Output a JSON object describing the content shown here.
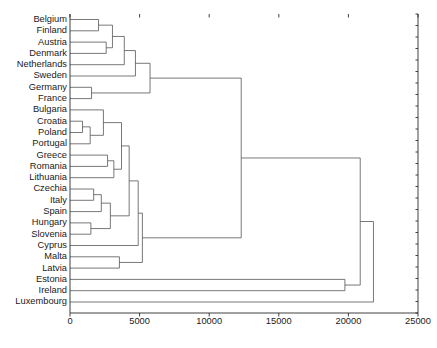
{
  "chart_data": {
    "type": "dendrogram",
    "title": "",
    "xlabel": "",
    "ylabel": "",
    "xlim": [
      0,
      25000
    ],
    "xticks": [
      0,
      5000,
      10000,
      15000,
      20000,
      25000
    ],
    "xtick_labels": [
      "0",
      "5000",
      "10000",
      "15000",
      "20000",
      "25000"
    ],
    "grid": false,
    "orientation": "left",
    "leaf_order": [
      "Belgium",
      "Finland",
      "Austria",
      "Denmark",
      "Netherlands",
      "Sweden",
      "Germany",
      "France",
      "Bulgaria",
      "Croatia",
      "Poland",
      "Portugal",
      "Greece",
      "Romania",
      "Lithuania",
      "Czechia",
      "Italy",
      "Spain",
      "Hungary",
      "Slovenia",
      "Cyprus",
      "Malta",
      "Latvia",
      "Estonia",
      "Ireland",
      "Luxembourg"
    ],
    "leaf_labels": [
      "Belgium",
      "Finland",
      "Austria",
      "Denmark",
      "Netherlands",
      "Sweden",
      "Germany",
      "France",
      "Bulgaria",
      "Croatia",
      "Poland",
      "Portugal",
      "Greece",
      "Romania",
      "Lithuania",
      "Czechia",
      "Italy",
      "Spain",
      "Hungary",
      "Slovenia",
      "Cyprus",
      "Malta",
      "Latvia",
      "Estonia",
      "Ireland",
      "Luxembourg"
    ],
    "merges": [
      {
        "id": "m1",
        "left": "Belgium",
        "right": "Finland",
        "distance": 2050
      },
      {
        "id": "m2",
        "left": "Austria",
        "right": "Denmark",
        "distance": 2600
      },
      {
        "id": "m3",
        "left": "m1",
        "right": "m2",
        "distance": 3050
      },
      {
        "id": "m4",
        "left": "m3",
        "right": "Netherlands",
        "distance": 3900
      },
      {
        "id": "m5",
        "left": "m4",
        "right": "Sweden",
        "distance": 4700
      },
      {
        "id": "m6",
        "left": "Germany",
        "right": "France",
        "distance": 1550
      },
      {
        "id": "m7",
        "left": "m5",
        "right": "m6",
        "distance": 5750
      },
      {
        "id": "m8",
        "left": "Croatia",
        "right": "Poland",
        "distance": 900
      },
      {
        "id": "m9",
        "left": "m8",
        "right": "Portugal",
        "distance": 1450
      },
      {
        "id": "m10",
        "left": "Bulgaria",
        "right": "m9",
        "distance": 2400
      },
      {
        "id": "m11",
        "left": "Greece",
        "right": "Romania",
        "distance": 2700
      },
      {
        "id": "m12",
        "left": "m11",
        "right": "Lithuania",
        "distance": 3150
      },
      {
        "id": "m13",
        "left": "m10",
        "right": "m12",
        "distance": 3700
      },
      {
        "id": "m14",
        "left": "Czechia",
        "right": "Italy",
        "distance": 1700
      },
      {
        "id": "m15",
        "left": "Hungary",
        "right": "Slovenia",
        "distance": 1500
      },
      {
        "id": "m16",
        "left": "m14",
        "right": "Spain",
        "distance": 2250
      },
      {
        "id": "m17",
        "left": "m16",
        "right": "m15",
        "distance": 2900
      },
      {
        "id": "m18",
        "left": "m13",
        "right": "m17",
        "distance": 4250
      },
      {
        "id": "m19",
        "left": "m18",
        "right": "Cyprus",
        "distance": 4900
      },
      {
        "id": "m20",
        "left": "Malta",
        "right": "Latvia",
        "distance": 3550
      },
      {
        "id": "m21",
        "left": "m19",
        "right": "m20",
        "distance": 5200
      },
      {
        "id": "m22",
        "left": "m7",
        "right": "m21",
        "distance": 12300
      },
      {
        "id": "m23",
        "left": "Estonia",
        "right": "Ireland",
        "distance": 19750
      },
      {
        "id": "m24",
        "left": "m22",
        "right": "m23",
        "distance": 20850
      },
      {
        "id": "m25",
        "left": "m24",
        "right": "Luxembourg",
        "distance": 21800
      }
    ],
    "colors": {
      "link": "#555555",
      "axis": "#2b2b2b",
      "text": "#1a1a1a",
      "background": "#ffffff"
    },
    "geometry": {
      "plot_left": 70,
      "plot_right": 418,
      "plot_top": 14,
      "plot_bottom": 313,
      "leaf_start_y": 19.5,
      "leaf_step": 11.3,
      "label_right_x": 67,
      "tick_length": 3.5,
      "tick_label_y": 318
    }
  }
}
